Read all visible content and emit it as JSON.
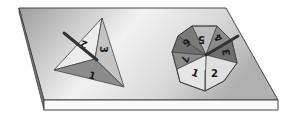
{
  "figure": {
    "colors": {
      "board_top_light": "#f4f4f4",
      "board_top_dark": "#a8a8a8",
      "board_edge": "#fafafa",
      "outline": "#444444",
      "sector_light": "#e6e6e6",
      "sector_mid": "#bdbdbd",
      "sector_dark": "#8a8a8a",
      "sector_darker": "#6f6f6f",
      "pointer": "#333333"
    },
    "triangle_spinner": {
      "sections": [
        {
          "label": "1",
          "shade": "dark"
        },
        {
          "label": "2",
          "shade": "light"
        },
        {
          "label": "3",
          "shade": "mid"
        }
      ]
    },
    "octagon_spinner": {
      "sections": [
        {
          "label": "1",
          "shade": "light"
        },
        {
          "label": "2",
          "shade": "light"
        },
        {
          "label": "3",
          "shade": "darker"
        },
        {
          "label": "4",
          "shade": "dark"
        },
        {
          "label": "5",
          "shade": "mid"
        },
        {
          "label": "6",
          "shade": "darker"
        },
        {
          "label": "7",
          "shade": "dark"
        },
        {
          "label": "8",
          "shade": "darker"
        }
      ]
    }
  }
}
